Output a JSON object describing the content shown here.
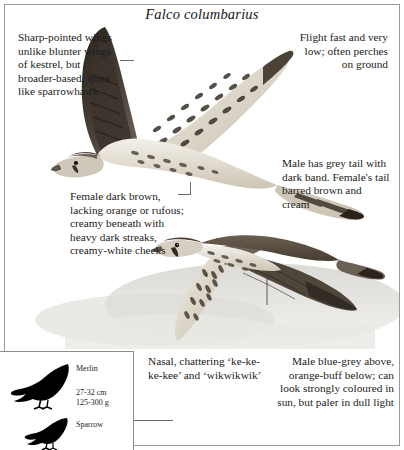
{
  "plate": {
    "title": "Falco columbarius",
    "species_common_name": "Merlin"
  },
  "captions": [
    {
      "id": "wing-shape",
      "align": "left",
      "text": "Sharp-pointed wings unlike blunter wings of kestrel, but broader-based, quite like sparrowhawk"
    },
    {
      "id": "flight-behaviour",
      "align": "right",
      "text": "Flight fast and very low; often perches on ground"
    },
    {
      "id": "tail-pattern",
      "align": "left",
      "text": "Male has grey tail with dark band. Female's tail barred brown and cream"
    },
    {
      "id": "female-plumage",
      "align": "left",
      "text": "Female dark brown, lacking orange or rufous; creamy beneath with heavy dark streaks, creamy-white cheeks"
    },
    {
      "id": "voice",
      "align": "left",
      "text": "Nasal, chattering ‘ke-ke-ke-kee’ and ‘wikwikwik’"
    },
    {
      "id": "male-plumage",
      "align": "right",
      "text": "Male blue-grey above, orange-buff below; can look strongly coloured in sun, but paler in dull light"
    }
  ],
  "size_inset": {
    "species_label": "Merlin",
    "length": "27-32 cm",
    "weight": "125-300 g",
    "comparison_label": "Sparrow"
  },
  "colors": {
    "ink": "#1b1c20",
    "border": "#8d8d8d",
    "silhouette": "#000000",
    "plumage_dark": "#3a332c",
    "plumage_mid": "#8d8073",
    "plumage_light": "#d9d2c6",
    "background_wash": "#d8d8d4"
  }
}
